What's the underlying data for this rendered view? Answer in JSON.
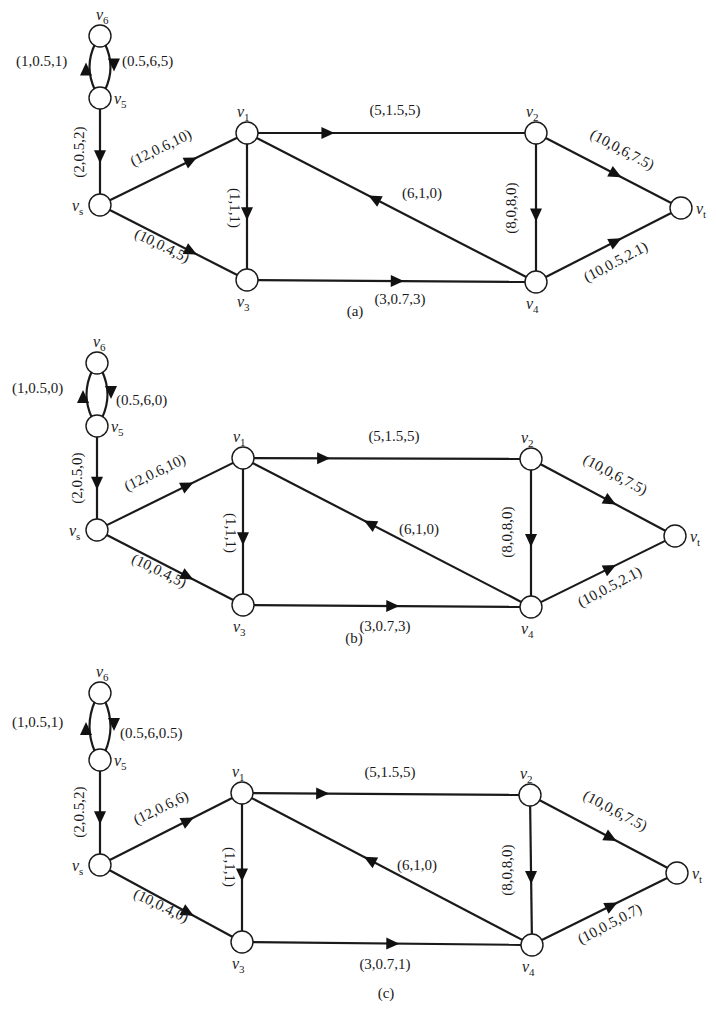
{
  "figure": {
    "panels": [
      {
        "caption": "(a)",
        "caption_pos": [
          355,
          316
        ],
        "nodes": {
          "v6": [
            100,
            36
          ],
          "v5": [
            100,
            98
          ],
          "vs": [
            100,
            205
          ],
          "v1": [
            247,
            133
          ],
          "v3": [
            247,
            280
          ],
          "v2": [
            536,
            133
          ],
          "v4": [
            536,
            282
          ],
          "vt": [
            681,
            208
          ]
        },
        "edges": [
          {
            "id": "v5-v6",
            "from": "v5",
            "to": "v6",
            "label": "(1,0.5,1)",
            "curve": "left",
            "lx": 16,
            "ly": 66,
            "anchor": "start",
            "rot": 0
          },
          {
            "id": "v6-v5",
            "from": "v6",
            "to": "v5",
            "label": "(0.5,6,5)",
            "curve": "right",
            "lx": 122,
            "ly": 66,
            "anchor": "start",
            "rot": 0
          },
          {
            "id": "v5-vs",
            "from": "v5",
            "to": "vs",
            "label": "(2,0.5,2)",
            "lx": 84,
            "ly": 152,
            "anchor": "middle",
            "rot": -90
          },
          {
            "id": "vs-v1",
            "from": "vs",
            "to": "v1",
            "label": "(12,0.6,10)",
            "lx": 163,
            "ly": 152,
            "anchor": "middle",
            "rot": -26
          },
          {
            "id": "vs-v3",
            "from": "vs",
            "to": "v3",
            "label": "(10,0.4,5)",
            "lx": 160,
            "ly": 250,
            "anchor": "middle",
            "rot": 26
          },
          {
            "id": "v1-v3",
            "from": "v1",
            "to": "v3",
            "label": "(1,1,1)",
            "lx": 230,
            "ly": 208,
            "anchor": "middle",
            "rot": 90
          },
          {
            "id": "v1-v2",
            "from": "v1",
            "to": "v2",
            "label": "(5,1.5,5)",
            "lx": 395,
            "ly": 115,
            "anchor": "middle",
            "rot": 0
          },
          {
            "id": "v4-v1",
            "from": "v4",
            "to": "v1",
            "label": "(6,1,0)",
            "lx": 402,
            "ly": 198,
            "anchor": "start",
            "rot": 0
          },
          {
            "id": "v2-v4",
            "from": "v2",
            "to": "v4",
            "label": "(8,0,8,0)",
            "lx": 516,
            "ly": 208,
            "anchor": "middle",
            "rot": -90
          },
          {
            "id": "v3-v4",
            "from": "v3",
            "to": "v4",
            "label": "(3,0.7,3)",
            "lx": 400,
            "ly": 304,
            "anchor": "middle",
            "rot": 0
          },
          {
            "id": "v2-vt",
            "from": "v2",
            "to": "vt",
            "label": "(10,0,6,7.5)",
            "lx": 620,
            "ly": 154,
            "anchor": "middle",
            "rot": 28
          },
          {
            "id": "v4-vt",
            "from": "v4",
            "to": "vt",
            "label": "(10,0.5,2.1)",
            "lx": 618,
            "ly": 266,
            "anchor": "middle",
            "rot": -28
          }
        ]
      },
      {
        "caption": "(b)",
        "caption_pos": [
          354,
          643
        ],
        "nodes": {
          "v6": [
            97,
            363
          ],
          "v5": [
            97,
            426
          ],
          "vs": [
            97,
            530
          ],
          "v1": [
            243,
            458
          ],
          "v3": [
            243,
            605
          ],
          "v2": [
            531,
            459
          ],
          "v4": [
            531,
            607
          ],
          "vt": [
            675,
            536
          ]
        },
        "edges": [
          {
            "id": "v5-v6",
            "from": "v5",
            "to": "v6",
            "label": "(1,0.5,0)",
            "curve": "left",
            "lx": 12,
            "ly": 393,
            "anchor": "start",
            "rot": 0
          },
          {
            "id": "v6-v5",
            "from": "v6",
            "to": "v5",
            "label": "(0.5,6,0)",
            "curve": "right",
            "lx": 116,
            "ly": 405,
            "anchor": "start",
            "rot": 0
          },
          {
            "id": "v5-vs",
            "from": "v5",
            "to": "vs",
            "label": "(2,0.5,0)",
            "lx": 82,
            "ly": 478,
            "anchor": "middle",
            "rot": -90
          },
          {
            "id": "vs-v1",
            "from": "vs",
            "to": "v1",
            "label": "(12,0.6,10)",
            "lx": 157,
            "ly": 477,
            "anchor": "middle",
            "rot": -26
          },
          {
            "id": "vs-v3",
            "from": "vs",
            "to": "v3",
            "label": "(10,0.4,5)",
            "lx": 157,
            "ly": 575,
            "anchor": "middle",
            "rot": 26
          },
          {
            "id": "v1-v3",
            "from": "v1",
            "to": "v3",
            "label": "(1,1,1)",
            "lx": 226,
            "ly": 533,
            "anchor": "middle",
            "rot": 90
          },
          {
            "id": "v1-v2",
            "from": "v1",
            "to": "v2",
            "label": "(5,1.5,5)",
            "lx": 394,
            "ly": 441,
            "anchor": "middle",
            "rot": 0
          },
          {
            "id": "v4-v1",
            "from": "v4",
            "to": "v1",
            "label": "(6,1,0)",
            "lx": 399,
            "ly": 534,
            "anchor": "start",
            "rot": 0
          },
          {
            "id": "v2-v4",
            "from": "v2",
            "to": "v4",
            "label": "(8,0,8,0)",
            "lx": 512,
            "ly": 532,
            "anchor": "middle",
            "rot": -90
          },
          {
            "id": "v3-v4",
            "from": "v3",
            "to": "v4",
            "label": "(3,0.7,3)",
            "lx": 385,
            "ly": 631,
            "anchor": "middle",
            "rot": 0
          },
          {
            "id": "v2-vt",
            "from": "v2",
            "to": "vt",
            "label": "(10,0,6,7.5)",
            "lx": 613,
            "ly": 479,
            "anchor": "middle",
            "rot": 28
          },
          {
            "id": "v4-vt",
            "from": "v4",
            "to": "vt",
            "label": "(10,0.5,2.1)",
            "lx": 612,
            "ly": 591,
            "anchor": "middle",
            "rot": -28
          }
        ]
      },
      {
        "caption": "(c)",
        "caption_pos": [
          386,
          998
        ],
        "nodes": {
          "v6": [
            100,
            693
          ],
          "v5": [
            100,
            760
          ],
          "vs": [
            100,
            865
          ],
          "v1": [
            242,
            793
          ],
          "v3": [
            242,
            942
          ],
          "v2": [
            530,
            795
          ],
          "v4": [
            532,
            945
          ],
          "vt": [
            677,
            873
          ]
        },
        "edges": [
          {
            "id": "v5-v6",
            "from": "v5",
            "to": "v6",
            "label": "(1,0.5,1)",
            "curve": "left",
            "lx": 12,
            "ly": 727,
            "anchor": "start",
            "rot": 0
          },
          {
            "id": "v6-v5",
            "from": "v6",
            "to": "v5",
            "label": "(0.5,6,0.5)",
            "curve": "right",
            "lx": 120,
            "ly": 738,
            "anchor": "start",
            "rot": 0
          },
          {
            "id": "v5-vs",
            "from": "v5",
            "to": "vs",
            "label": "(2,0.5,2)",
            "lx": 84,
            "ly": 812,
            "anchor": "middle",
            "rot": -90
          },
          {
            "id": "vs-v1",
            "from": "vs",
            "to": "v1",
            "label": "(12,0.6,6)",
            "lx": 163,
            "ly": 812,
            "anchor": "middle",
            "rot": -26
          },
          {
            "id": "vs-v3",
            "from": "vs",
            "to": "v3",
            "label": "(10,0.4,0)",
            "lx": 159,
            "ly": 910,
            "anchor": "middle",
            "rot": 26
          },
          {
            "id": "v1-v3",
            "from": "v1",
            "to": "v3",
            "label": "(1,1,1)",
            "lx": 225,
            "ly": 867,
            "anchor": "middle",
            "rot": 90
          },
          {
            "id": "v1-v2",
            "from": "v1",
            "to": "v2",
            "label": "(5,1.5,5)",
            "lx": 390,
            "ly": 777,
            "anchor": "middle",
            "rot": 0
          },
          {
            "id": "v4-v1",
            "from": "v4",
            "to": "v1",
            "label": "(6,1,0)",
            "lx": 397,
            "ly": 870,
            "anchor": "start",
            "rot": 0
          },
          {
            "id": "v2-v4",
            "from": "v2",
            "to": "v4",
            "label": "(8,0,8,0)",
            "lx": 512,
            "ly": 870,
            "anchor": "middle",
            "rot": -90
          },
          {
            "id": "v3-v4",
            "from": "v3",
            "to": "v4",
            "label": "(3,0.7,1)",
            "lx": 385,
            "ly": 969,
            "anchor": "middle",
            "rot": 0
          },
          {
            "id": "v2-vt",
            "from": "v2",
            "to": "vt",
            "label": "(10,0,6,7.5)",
            "lx": 613,
            "ly": 815,
            "anchor": "middle",
            "rot": 28
          },
          {
            "id": "v4-vt",
            "from": "v4",
            "to": "vt",
            "label": "(10,0.5,0.7)",
            "lx": 612,
            "ly": 928,
            "anchor": "middle",
            "rot": -28
          }
        ]
      }
    ],
    "vertex_labels": {
      "v6": {
        "base": "v",
        "sub": "6",
        "dx": -4,
        "dy": -16
      },
      "v5": {
        "base": "v",
        "sub": "5",
        "dx": 14,
        "dy": 6
      },
      "vs": {
        "base": "v",
        "sub": "s",
        "dx": -28,
        "dy": 6
      },
      "v1": {
        "base": "v",
        "sub": "1",
        "dx": -10,
        "dy": -16
      },
      "v3": {
        "base": "v",
        "sub": "3",
        "dx": -10,
        "dy": 27
      },
      "v2": {
        "base": "v",
        "sub": "2",
        "dx": -10,
        "dy": -16
      },
      "v4": {
        "base": "v",
        "sub": "4",
        "dx": -10,
        "dy": 27
      },
      "vt": {
        "base": "v",
        "sub": "t",
        "dx": 15,
        "dy": 6
      }
    },
    "node_radius": 11,
    "colors": {
      "stroke": "#1a1a1a",
      "node_fill": "#ffffff",
      "background": "#ffffff"
    }
  }
}
